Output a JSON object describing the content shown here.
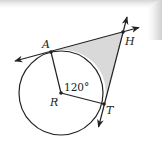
{
  "diagram": {
    "type": "geometry",
    "points": {
      "A": {
        "label": "A",
        "x": 51,
        "y": 52
      },
      "H": {
        "label": "H",
        "x": 123,
        "y": 32
      },
      "R": {
        "label": "R",
        "x": 61,
        "y": 93
      },
      "T": {
        "label": "T",
        "x": 104,
        "y": 104
      }
    },
    "circle": {
      "center": "R",
      "radius": 42
    },
    "angle_label": "120°",
    "colors": {
      "stroke": "#222222",
      "shade": "#d9d9d9",
      "background": "#ffffff"
    }
  }
}
